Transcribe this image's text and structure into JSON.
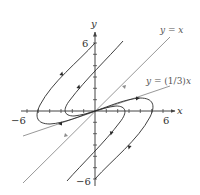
{
  "figure": {
    "type": "phase-portrait",
    "axes": {
      "x_label": "x",
      "y_label": "y",
      "x_min_label": "−6",
      "x_max_label": "6",
      "y_max_label": "6",
      "y_min_label": "−6",
      "range": [
        -6,
        6
      ],
      "tick_step": 1
    },
    "lines": [
      {
        "name": "y=x",
        "label_parts": [
          "y",
          " = ",
          "x"
        ],
        "color": "#8a8a8a"
      },
      {
        "name": "y=(1/3)x",
        "label_parts": [
          "y",
          " = (1/3)",
          "x"
        ],
        "color": "#8a8a8a"
      }
    ],
    "colors": {
      "axis": "#444444",
      "trajectory": "#2a2a2a",
      "eigenline": "#8c8c8c",
      "label": "#333333"
    }
  }
}
